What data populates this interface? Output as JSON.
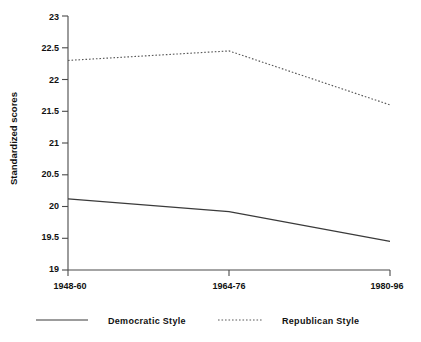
{
  "chart_data": {
    "type": "line",
    "title": "",
    "xlabel": "",
    "ylabel": "Standardized scores",
    "categories": [
      "1948-60",
      "1964-76",
      "1980-96"
    ],
    "ylim": [
      19,
      23
    ],
    "yticks": [
      "19",
      "19.5",
      "20",
      "20.5",
      "21",
      "21.5",
      "22",
      "22.5",
      "23"
    ],
    "ytick_values": [
      19,
      19.5,
      20,
      20.5,
      21,
      21.5,
      22,
      22.5,
      23
    ],
    "grid": false,
    "legend_position": "bottom",
    "series": [
      {
        "name": "Democratic Style",
        "style": "solid",
        "color": "#3a3a3a",
        "values": [
          20.12,
          19.92,
          19.45
        ]
      },
      {
        "name": "Republican Style",
        "style": "dotted",
        "color": "#5a5a5a",
        "values": [
          22.3,
          22.45,
          21.6
        ]
      }
    ]
  },
  "axis": {
    "y_title": "Standardized scores"
  },
  "legend": {
    "items": [
      {
        "label": "Democratic Style"
      },
      {
        "label": "Republican Style"
      }
    ]
  }
}
